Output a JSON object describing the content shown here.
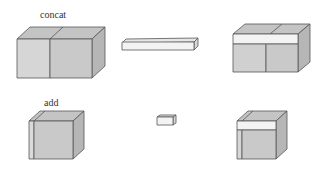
{
  "rows": [
    {
      "label": "concat",
      "label_pos": {
        "x": 40,
        "y": 9
      }
    },
    {
      "label": "add",
      "label_pos": {
        "x": 44,
        "y": 97
      }
    }
  ],
  "colors": {
    "front_left": "#d4d4d4",
    "front_right": "#c8c8c8",
    "top": "#c0c0c0",
    "side": "#b4b4b4",
    "bar_front": "#f2f2f2",
    "bar_top": "#e4e4e4",
    "bar_side": "#d8d8d8",
    "stroke": "#555555"
  }
}
